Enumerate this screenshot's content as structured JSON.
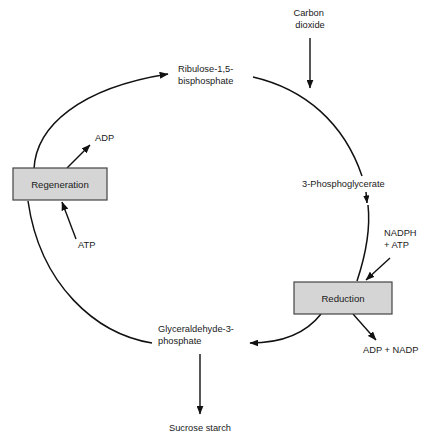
{
  "diagram": {
    "type": "cycle-diagram",
    "colors": {
      "box_fill": "#d5d5d5",
      "box_stroke": "#444444",
      "line": "#111111",
      "text": "#1a1a1a",
      "background": "#ffffff"
    },
    "boxes": [
      {
        "id": "regeneration",
        "label": "Regeneration",
        "x": 13,
        "y": 168,
        "w": 94,
        "h": 32
      },
      {
        "id": "reduction",
        "label": "Reduction",
        "x": 294,
        "y": 282,
        "w": 98,
        "h": 32
      }
    ],
    "labels": [
      {
        "id": "carbon-dioxide",
        "lines": [
          "Carbon",
          "dioxide"
        ],
        "x": 310,
        "y": 16,
        "anchor": "middle"
      },
      {
        "id": "ribulose-bisphosphate",
        "lines": [
          "Ribulose-1,5-",
          "bisphosphate"
        ],
        "x": 178,
        "y": 72,
        "anchor": "start"
      },
      {
        "id": "adp",
        "lines": [
          "ADP"
        ],
        "x": 95,
        "y": 141,
        "anchor": "start"
      },
      {
        "id": "phosphoglycerate",
        "lines": [
          "3-Phosphoglycerate"
        ],
        "x": 302,
        "y": 187,
        "anchor": "start"
      },
      {
        "id": "atp",
        "lines": [
          "ATP"
        ],
        "x": 78,
        "y": 248,
        "anchor": "start"
      },
      {
        "id": "nadph-atp",
        "lines": [
          "NADPH",
          "+ ATP"
        ],
        "x": 384,
        "y": 236,
        "anchor": "start"
      },
      {
        "id": "glyceraldehyde-phosphate",
        "lines": [
          "Glyceraldehyde-3-",
          "phosphate"
        ],
        "x": 158,
        "y": 332,
        "anchor": "start"
      },
      {
        "id": "adp-nadp",
        "lines": [
          "ADP + NADP"
        ],
        "x": 363,
        "y": 353,
        "anchor": "start"
      },
      {
        "id": "sucrose-starch",
        "lines": [
          "Sucrose starch"
        ],
        "x": 200,
        "y": 431,
        "anchor": "middle"
      }
    ],
    "arrows": [
      {
        "id": "carbon-dioxide-input",
        "from": "Carbon dioxide",
        "to": "cycle (top right arc)",
        "kind": "straight"
      },
      {
        "id": "regeneration-to-ribulose",
        "from": "Regeneration",
        "to": "Ribulose-1,5-bisphosphate",
        "kind": "arc"
      },
      {
        "id": "ribulose-to-phosphoglycerate",
        "from": "Ribulose-1,5-bisphosphate",
        "to": "3-Phosphoglycerate",
        "kind": "arc"
      },
      {
        "id": "phosphoglycerate-to-reduction",
        "from": "3-Phosphoglycerate",
        "to": "Reduction",
        "kind": "arc"
      },
      {
        "id": "reduction-to-glyceraldehyde",
        "from": "Reduction",
        "to": "Glyceraldehyde-3-phosphate",
        "kind": "arc"
      },
      {
        "id": "glyceraldehyde-to-regeneration",
        "from": "Glyceraldehyde-3-phosphate",
        "to": "Regeneration",
        "kind": "arc"
      },
      {
        "id": "regeneration-releases-adp",
        "from": "Regeneration",
        "to": "ADP",
        "kind": "straight"
      },
      {
        "id": "atp-into-regeneration",
        "from": "ATP",
        "to": "Regeneration",
        "kind": "straight"
      },
      {
        "id": "nadph-atp-into-reduction",
        "from": "NADPH + ATP",
        "to": "Reduction",
        "kind": "straight"
      },
      {
        "id": "reduction-releases-adp-nadp",
        "from": "Reduction",
        "to": "ADP + NADP",
        "kind": "straight"
      },
      {
        "id": "glyceraldehyde-to-sucrose",
        "from": "Glyceraldehyde-3-phosphate",
        "to": "Sucrose starch",
        "kind": "straight"
      }
    ]
  }
}
